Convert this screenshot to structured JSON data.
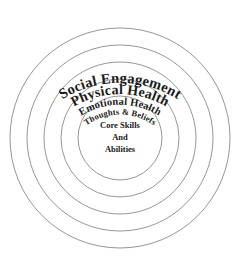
{
  "diagram": {
    "type": "concentric-circles",
    "title": "",
    "background_color": "#ffffff",
    "stroke_color": "#8a8a8a",
    "text_color": "#1a1a1a",
    "center": {
      "x": 120,
      "y": 138
    },
    "rings": [
      {
        "index": 0,
        "level": "outermost",
        "label": "Social Engagement",
        "radius": 110,
        "label_font_size": 14.5,
        "label_letter_spacing": 0.2
      },
      {
        "index": 1,
        "level": "second",
        "label": "Physical Health",
        "radius": 93,
        "label_font_size": 14,
        "label_letter_spacing": 0.2
      },
      {
        "index": 2,
        "level": "third",
        "label": "Emotional Health",
        "radius": 76,
        "label_font_size": 10.5,
        "label_letter_spacing": 0.1
      },
      {
        "index": 3,
        "level": "fourth",
        "label": "Thoughts & Beliefs",
        "radius": 59,
        "label_font_size": 8.5,
        "label_letter_spacing": 0.1
      },
      {
        "index": 4,
        "level": "innermost",
        "label": "",
        "radius": 42,
        "label_font_size": 0,
        "label_letter_spacing": 0
      }
    ],
    "core": {
      "lines": [
        "Core Skills",
        "And",
        "Abilities"
      ],
      "font_size": 8.5,
      "line_height": 12
    }
  }
}
